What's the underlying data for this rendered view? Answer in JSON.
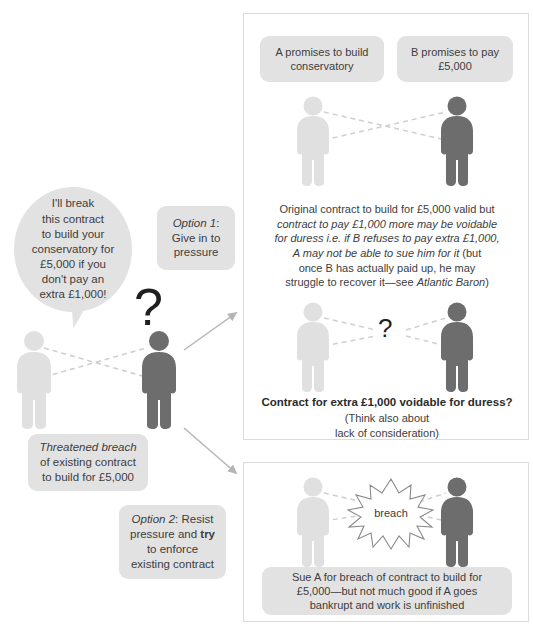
{
  "diagram": {
    "colors": {
      "figure_light": "#e0e0e0",
      "figure_dark": "#6d6d6d",
      "box_fill": "#e2e2e2",
      "panel_border": "#dcdcdc",
      "text": "#3d3d3d",
      "arrow": "#b0b0b0",
      "dashed_link": "#cccccc"
    }
  },
  "left": {
    "speech_bubble": {
      "name": "threat-speech-bubble",
      "lines": [
        "I'll break",
        "this contract",
        "to build your",
        "conservatory for",
        "£5,000 if you",
        "don't pay an",
        "extra £1,000!"
      ]
    },
    "question_mark": "?",
    "figures": [
      {
        "name": "figure-a-light",
        "role": "A"
      },
      {
        "name": "figure-b-dark",
        "role": "B"
      }
    ],
    "option1": {
      "label_italic": "Option 1",
      "label_rest": ":",
      "lines": [
        "Give in to",
        "pressure"
      ]
    },
    "option2": {
      "label_italic": "Option 2",
      "label_rest": ": Resist",
      "line2_a": "pressure and ",
      "line2_bold": "try",
      "lines_rest": [
        "to enforce",
        "existing contract"
      ]
    },
    "threatened_breach": {
      "italic_line": "Threatened breach",
      "lines": [
        "of existing contract",
        "to build for £5,000"
      ]
    }
  },
  "panel1": {
    "name": "option-1-panel",
    "promise_a": {
      "lines": [
        "A promises to build",
        "conservatory"
      ]
    },
    "promise_b": {
      "lines": [
        "B promises to pay",
        "£5,000"
      ]
    },
    "explanation": {
      "line1_plain": "Original contract to build for £5,000 valid but",
      "line2_italic": "contract to pay £1,000 more may be voidable",
      "line3_italic": "for duress i.e. if B refuses to pay extra £1,000,",
      "line4_italic": "A may not be able to sue him for it",
      "line4_plain": " (but",
      "line5_plain": "once B has actually paid up, he may",
      "line6_plain": "struggle to recover it—see ",
      "line6_italic": "Atlantic Baron",
      "line6_tail": ")"
    },
    "question_mark": "?",
    "conclusion_bold": "Contract for extra £1,000 voidable for duress?",
    "conclusion_sub": [
      "(Think also about",
      "lack of consideration)"
    ]
  },
  "panel2": {
    "name": "option-2-panel",
    "burst_label": "breach",
    "outcome": {
      "lines": [
        "Sue A for breach of contract to build for",
        "£5,000—but not much good if A goes",
        "bankrupt and work is unfinished"
      ]
    }
  }
}
